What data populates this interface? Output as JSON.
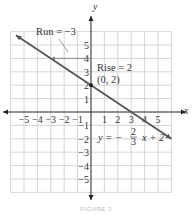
{
  "chart_data": {
    "type": "line",
    "title": "",
    "caption": "FIGURE 3",
    "xlabel": "x",
    "ylabel": "y",
    "xlim": [
      -6,
      6
    ],
    "ylim": [
      -6,
      6
    ],
    "grid": true,
    "x_ticks": [
      -5,
      -4,
      -3,
      -2,
      -1,
      1,
      2,
      3,
      4,
      5
    ],
    "y_ticks": [
      5,
      4,
      3,
      2,
      1,
      -1,
      -2,
      -3,
      -4,
      -5
    ],
    "series": [
      {
        "name": "y = -2/3 x + 2",
        "slope": -0.6667,
        "intercept": 2,
        "x": [
          -5.6,
          6
        ],
        "y": [
          5.733,
          -2
        ]
      }
    ],
    "points": [
      {
        "label": "(0, 2)",
        "x": 0,
        "y": 2
      }
    ],
    "annotations": {
      "run": "Run = −3",
      "rise": "Rise = 2",
      "point_label": "(0, 2)",
      "equation_lhs": "y = −",
      "equation_num": "2",
      "equation_den": "3",
      "equation_rhs": "x + 2"
    },
    "colors": {
      "line": "#555555",
      "grid": "#cccccc",
      "axis": "#222222"
    }
  }
}
